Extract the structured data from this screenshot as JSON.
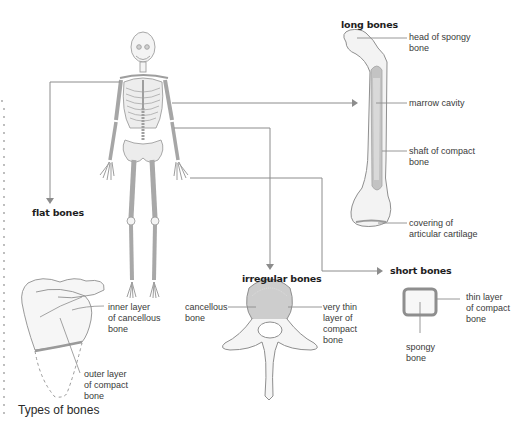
{
  "caption": "Types of bones",
  "categories": {
    "long": {
      "title": "long bones",
      "labels": [
        "head of spongy\nbone",
        "marrow cavity",
        "shaft of compact\nbone",
        "covering of\narticular cartilage"
      ]
    },
    "flat": {
      "title": "flat bones",
      "labels": [
        "inner layer\nof cancellous\nbone",
        "outer layer\nof compact\nbone"
      ]
    },
    "irregular": {
      "title": "irregular bones",
      "labels": [
        "cancellous\nbone",
        "very thin\nlayer of\ncompact\nbone"
      ]
    },
    "short": {
      "title": "short bones",
      "labels": [
        "thin layer\nof compact\nbone",
        "spongy\nbone"
      ]
    }
  },
  "colors": {
    "line": "#8a8a8a",
    "bone_outline": "#9a9a9a",
    "compact": "#b5b5b5",
    "margin_dots": "#9a9a9a"
  }
}
